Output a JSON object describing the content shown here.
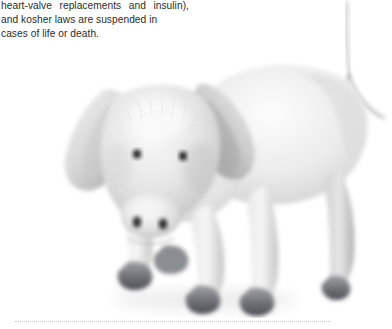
{
  "page": {
    "width": 392,
    "height": 329,
    "background_color": "#ffffff"
  },
  "body_text": {
    "line1_left": "heart-valve",
    "line1_mid": "replacements",
    "line1_right_a": "and",
    "line1_right_b": "insulin),",
    "line2": "and kosher laws are suspended in",
    "line3": "cases of life or death.",
    "full_text": "heart-valve replacements and insulin), and kosher laws are suspended in cases of life or death.",
    "text_color": "#2c2c2e",
    "alignment": "justified"
  },
  "photograph": {
    "subject": "young pig standing facing the viewer",
    "caption": "",
    "style": "grayscale photograph on white background",
    "colors": {
      "shadow": "#9a9a9a",
      "midtone": "#d2d2d2",
      "highlight": "#f4f4f4",
      "hoof": "#5e6166",
      "eye": "#1d1d1f",
      "nostril": "#2a2a2c",
      "tail": "#b7b7b7"
    }
  },
  "divider": {
    "style": "dotted",
    "color": "#c3c3c3"
  }
}
